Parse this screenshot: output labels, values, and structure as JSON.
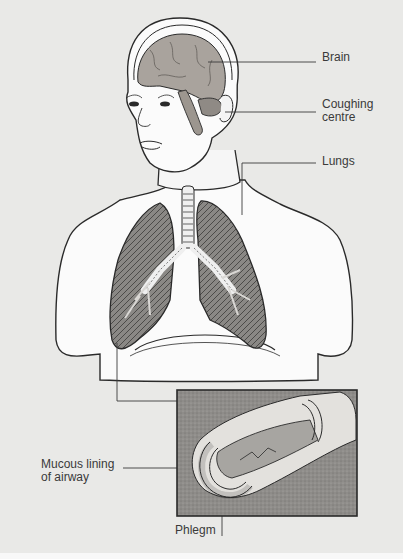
{
  "diagram": {
    "type": "anatomical-illustration",
    "background_color": "#e9e9e7",
    "labels": {
      "brain": "Brain",
      "coughing_centre_line1": "Coughing",
      "coughing_centre_line2": "centre",
      "lungs": "Lungs",
      "mucous_line1": "Mucous lining",
      "mucous_line2": "of airway",
      "phlegm": "Phlegm"
    },
    "inset": {
      "description": "Cut-away of bronchial airway showing phlegm",
      "x": 177,
      "y": 390,
      "width": 180,
      "height": 126
    },
    "colors": {
      "outline": "#2a2a2a",
      "brain_fill": "#a9a39d",
      "lung_fill": "#7d7b78",
      "skin_fill": "#fafafa",
      "inset_bg": "#8e8c89",
      "airway_fill": "#d8d6d2",
      "phlegm_fill": "#a7a5a1",
      "leader_line": "#3a3a3a"
    }
  }
}
